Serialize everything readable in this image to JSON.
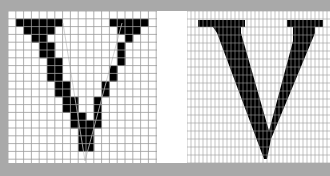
{
  "figure": {
    "background_color": "#a9a9a9",
    "glyph_color": "#000000",
    "grid_line_color": "#9a9a9a",
    "left_panel": {
      "label": "V",
      "resolution": "low",
      "cols": 19,
      "rows": 19,
      "cell_px": 7.8,
      "filled_cells": [
        [
          1,
          1
        ],
        [
          1,
          2
        ],
        [
          1,
          3
        ],
        [
          1,
          4
        ],
        [
          1,
          5
        ],
        [
          1,
          6
        ],
        [
          1,
          13
        ],
        [
          1,
          14
        ],
        [
          1,
          15
        ],
        [
          1,
          16
        ],
        [
          1,
          17
        ],
        [
          2,
          2
        ],
        [
          2,
          3
        ],
        [
          2,
          4
        ],
        [
          2,
          5
        ],
        [
          2,
          14
        ],
        [
          2,
          15
        ],
        [
          2,
          16
        ],
        [
          3,
          3
        ],
        [
          3,
          4
        ],
        [
          3,
          15
        ],
        [
          4,
          4
        ],
        [
          4,
          5
        ],
        [
          4,
          14
        ],
        [
          5,
          4
        ],
        [
          5,
          5
        ],
        [
          5,
          14
        ],
        [
          6,
          5
        ],
        [
          6,
          6
        ],
        [
          6,
          14
        ],
        [
          7,
          5
        ],
        [
          7,
          6
        ],
        [
          7,
          13
        ],
        [
          8,
          5
        ],
        [
          8,
          6
        ],
        [
          8,
          13
        ],
        [
          9,
          6
        ],
        [
          9,
          7
        ],
        [
          9,
          12
        ],
        [
          10,
          6
        ],
        [
          10,
          7
        ],
        [
          10,
          12
        ],
        [
          11,
          7
        ],
        [
          11,
          8
        ],
        [
          11,
          11
        ],
        [
          12,
          7
        ],
        [
          12,
          8
        ],
        [
          12,
          11
        ],
        [
          13,
          8
        ],
        [
          13,
          9
        ],
        [
          13,
          11
        ],
        [
          14,
          8
        ],
        [
          14,
          9
        ],
        [
          14,
          10
        ],
        [
          14,
          11
        ],
        [
          15,
          9
        ],
        [
          15,
          10
        ],
        [
          16,
          9
        ],
        [
          16,
          10
        ],
        [
          17,
          9
        ],
        [
          17,
          10
        ]
      ]
    },
    "right_panel": {
      "label": "V",
      "resolution": "high",
      "cell_px": 4,
      "outline_points": "11,9 58,9 58,16 54,16 54,22 82,120 106,30 106,16 100,16 100,9 136,9 136,16 128,16 128,22 84,128 80,148 77,148 30,22 26,16 11,16"
    }
  }
}
